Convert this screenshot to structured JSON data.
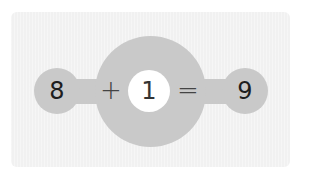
{
  "equation": {
    "addend1": "8",
    "operator": "+",
    "addend2": "1",
    "equals": "=",
    "sum": "9"
  },
  "colors": {
    "panel": "#f1f1f1",
    "circle": "#c9c9c9",
    "answer_circle": "#ffffff",
    "text": "#1e1e1e"
  }
}
